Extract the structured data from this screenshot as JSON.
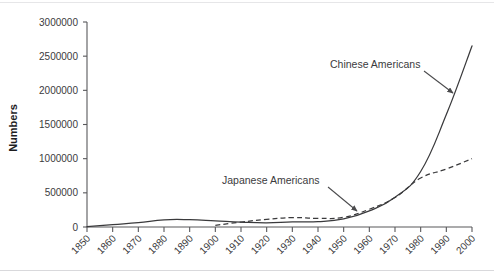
{
  "chart_data": {
    "type": "line",
    "title": "",
    "xlabel": "",
    "ylabel": "Numbers",
    "xlim": [
      1850,
      2000
    ],
    "ylim": [
      0,
      3000000
    ],
    "grid": false,
    "legend_position": "inline-annotations",
    "x": [
      1850,
      1860,
      1870,
      1880,
      1890,
      1900,
      1910,
      1920,
      1930,
      1940,
      1950,
      1960,
      1970,
      1980,
      1990,
      2000
    ],
    "xtick_labels": [
      "1850",
      "1860",
      "1870",
      "1880",
      "1890",
      "1900",
      "1910",
      "1920",
      "1930",
      "1940",
      "1950",
      "1960",
      "1970",
      "1980",
      "1990",
      "2000"
    ],
    "ytick_labels": [
      "0",
      "500000",
      "1000000",
      "1500000",
      "2000000",
      "2500000",
      "3000000"
    ],
    "ytick_values": [
      0,
      500000,
      1000000,
      1500000,
      2000000,
      2500000,
      3000000
    ],
    "series": [
      {
        "name": "Chinese Americans",
        "style": "solid",
        "color": "#3a3a3c",
        "x": [
          1850,
          1860,
          1870,
          1880,
          1890,
          1900,
          1910,
          1920,
          1930,
          1940,
          1950,
          1960,
          1970,
          1980,
          1990,
          2000
        ],
        "values": [
          4000,
          35000,
          63000,
          105000,
          107000,
          90000,
          72000,
          62000,
          75000,
          78000,
          118000,
          237000,
          435000,
          812000,
          1645000,
          2650000
        ]
      },
      {
        "name": "Japanese Americans",
        "style": "dashed",
        "color": "#3a3a3c",
        "x": [
          1900,
          1910,
          1920,
          1930,
          1940,
          1950,
          1960,
          1970,
          1980,
          1990,
          2000
        ],
        "values": [
          24000,
          72000,
          111000,
          138000,
          127000,
          142000,
          260000,
          431000,
          716000,
          848000,
          1000000
        ]
      }
    ],
    "annotations": [
      {
        "name": "chinese-americans-annotation",
        "text": "Chinese Americans",
        "label_x": 330,
        "label_y": 68,
        "arrow_from_x": 424,
        "arrow_from_y": 71,
        "arrow_to_x": 453,
        "arrow_to_y": 93
      },
      {
        "name": "japanese-americans-annotation",
        "text": "Japanese Americans",
        "label_x": 222,
        "label_y": 184,
        "arrow_from_x": 328,
        "arrow_from_y": 187,
        "arrow_to_x": 357,
        "arrow_to_y": 211
      }
    ]
  }
}
